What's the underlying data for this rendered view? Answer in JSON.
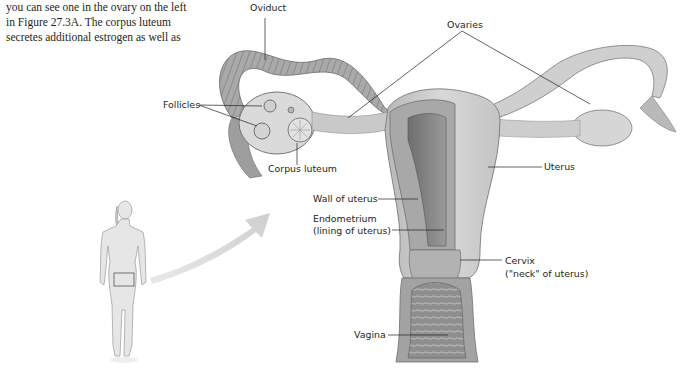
{
  "body_text": {
    "lines": [
      "you can see one in the ovary on the left",
      "in Figure 27.3A. The corpus luteum",
      "secretes additional estrogen as well as"
    ]
  },
  "figure": {
    "labels": {
      "oviduct": "Oviduct",
      "ovaries": "Ovaries",
      "follicles": "Follicles",
      "corpus_luteum": "Corpus luteum",
      "uterus": "Uterus",
      "wall_of_uterus": "Wall of uterus",
      "endometrium_1": "Endometrium",
      "endometrium_2": "(lining of uterus)",
      "cervix_1": "Cervix",
      "cervix_2": "(\"neck\" of uterus)",
      "vagina": "Vagina"
    },
    "colors": {
      "tissue_light": "#d9d9d9",
      "tissue_mid": "#b5b5b5",
      "tissue_dark": "#7d7d7d",
      "leader_line": "#231f20",
      "arrow": "#d6d6d6"
    }
  }
}
